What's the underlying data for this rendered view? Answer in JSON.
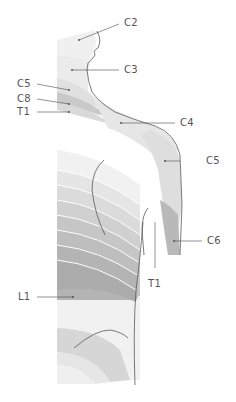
{
  "diagram": {
    "labels": [
      {
        "id": "C2",
        "text": "C2",
        "x": 126,
        "y": 19
      },
      {
        "id": "C3",
        "text": "C3",
        "x": 126,
        "y": 66
      },
      {
        "id": "C5-left",
        "text": "C5",
        "x": 17,
        "y": 80
      },
      {
        "id": "C8",
        "text": "C8",
        "x": 17,
        "y": 95
      },
      {
        "id": "T1-left",
        "text": "T1",
        "x": 17,
        "y": 108
      },
      {
        "id": "C4",
        "text": "C4",
        "x": 181,
        "y": 118
      },
      {
        "id": "C5-right",
        "text": "C5",
        "x": 166,
        "y": 156
      },
      {
        "id": "C6",
        "text": "C6",
        "x": 208,
        "y": 237
      },
      {
        "id": "T1-bottom",
        "text": "T1",
        "x": 148,
        "y": 278
      },
      {
        "id": "L1",
        "text": "L1",
        "x": 18,
        "y": 296
      }
    ],
    "colors": {
      "background": "#ffffff",
      "outline": "#5a5a5a",
      "leader": "#4a4a4a",
      "label": "#555555",
      "band_light": "#ececec",
      "band_mid": "#d2d2d2",
      "band_dark": "#b8b8b8",
      "band_darkest": "#a8a8a8"
    }
  }
}
